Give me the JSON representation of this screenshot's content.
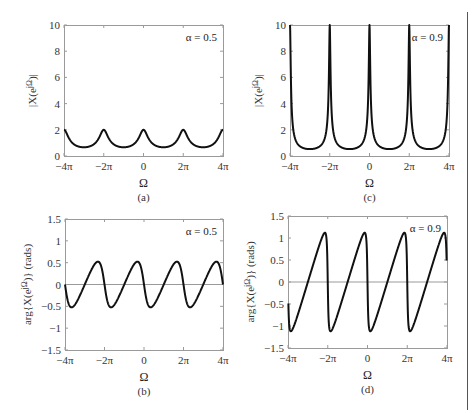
{
  "figure": {
    "right_rule_color": "#555555",
    "frame_color": "#9a9a9a",
    "curve_color": "#111111",
    "zero_line_color": "#9a9a9a"
  },
  "chart_data": [
    {
      "id": "a",
      "type": "line",
      "caption": "(a)",
      "title": "",
      "xlabel": "Ω",
      "ylabel": "|X(e^{jΩ})|",
      "annotation": "α = 0.5",
      "alpha": 0.5,
      "quantity": "magnitude",
      "formula": "1/sqrt(1 - 2α cosΩ + α²)",
      "xlim": [
        "-4π",
        "4π"
      ],
      "ylim": [
        0,
        10
      ],
      "xticks": [
        "-4π",
        "-2π",
        "0",
        "2π",
        "4π"
      ],
      "yticks": [
        "0",
        "2",
        "4",
        "6",
        "8",
        "10"
      ],
      "x": [
        "-4π",
        "-3π",
        "-2π",
        "-π",
        "0",
        "π",
        "2π",
        "3π",
        "4π"
      ],
      "values": [
        2.0,
        0.667,
        2.0,
        0.667,
        2.0,
        0.667,
        2.0,
        0.667,
        2.0
      ],
      "grid": false
    },
    {
      "id": "c",
      "type": "line",
      "caption": "(c)",
      "title": "",
      "xlabel": "Ω",
      "ylabel": "|X(e^{jΩ})|",
      "annotation": "α = 0.9",
      "alpha": 0.9,
      "quantity": "magnitude",
      "formula": "1/sqrt(1 - 2α cosΩ + α²)",
      "xlim": [
        "-4π",
        "4π"
      ],
      "ylim": [
        0,
        10
      ],
      "xticks": [
        "-4π",
        "-2π",
        "0",
        "2π",
        "4π"
      ],
      "yticks": [
        "0",
        "2",
        "4",
        "6",
        "8",
        "10"
      ],
      "x": [
        "-4π",
        "-3π",
        "-2π",
        "-π",
        "0",
        "π",
        "2π",
        "3π",
        "4π"
      ],
      "values": [
        10.0,
        0.526,
        10.0,
        0.526,
        10.0,
        0.526,
        10.0,
        0.526,
        10.0
      ],
      "grid": false
    },
    {
      "id": "b",
      "type": "line",
      "caption": "(b)",
      "title": "",
      "xlabel": "Ω",
      "ylabel": "arg{X(e^{jΩ})} (rads)",
      "annotation": "α = 0.5",
      "alpha": 0.5,
      "quantity": "phase",
      "formula": "-atan(α sinΩ / (1 - α cosΩ))",
      "xlim": [
        "-4π",
        "4π"
      ],
      "ylim": [
        -1.5,
        1.5
      ],
      "xticks": [
        "-4π",
        "-2π",
        "0",
        "2π",
        "4π"
      ],
      "yticks": [
        "-1.5",
        "-1",
        "-0.5",
        "0",
        "0.5",
        "1",
        "1.5"
      ],
      "extrema": {
        "max": 0.52,
        "min": -0.52
      },
      "zero_line": true,
      "grid": false
    },
    {
      "id": "d",
      "type": "line",
      "caption": "(d)",
      "title": "",
      "xlabel": "Ω",
      "ylabel": "arg{X(e^{jΩ})} (rads)",
      "annotation": "α = 0.9",
      "alpha": 0.9,
      "quantity": "phase",
      "formula": "-atan(α sinΩ / (1 - α cosΩ))",
      "xlim": [
        "-4π",
        "4π"
      ],
      "ylim": [
        -1.5,
        1.5
      ],
      "xticks": [
        "-4π",
        "-2π",
        "0",
        "2π",
        "4π"
      ],
      "yticks": [
        "-1.5",
        "-1",
        "-0.5",
        "0",
        "0.5",
        "1",
        "1.5"
      ],
      "extrema": {
        "max": 1.12,
        "min": -1.12
      },
      "endpoints": {
        "start": -0.5,
        "end": 0.5
      },
      "zero_line": true,
      "grid": false
    }
  ]
}
